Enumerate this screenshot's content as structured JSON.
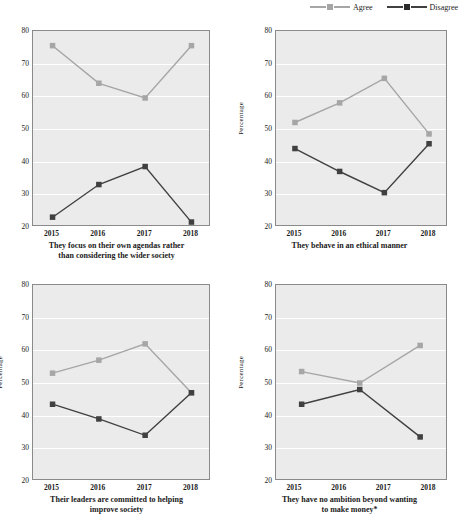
{
  "legend": {
    "items": [
      {
        "label": "Agree",
        "color": "#a6a6a6"
      },
      {
        "label": "Disagree",
        "color": "#404040"
      }
    ]
  },
  "axis": {
    "yticks": [
      20,
      30,
      40,
      50,
      60,
      70,
      80
    ],
    "xticks": [
      "2015",
      "2016",
      "2017",
      "2018"
    ],
    "ylabel": "Percentage"
  },
  "chart_data": [
    {
      "type": "line",
      "title": "They focus on their own agendas rather than considering the wider society",
      "caption_line1": "They focus on their own agendas rather",
      "caption_line2": "than considering the wider society",
      "xlabel": "",
      "ylabel": "",
      "categories": [
        "2015",
        "2016",
        "2017",
        "2018"
      ],
      "ylim": [
        20,
        80
      ],
      "yticks": [
        20,
        30,
        40,
        50,
        60,
        70,
        80
      ],
      "grid": true,
      "legend_position": "top-right",
      "series": [
        {
          "name": "Agree",
          "color": "#a6a6a6",
          "values": [
            75.5,
            64.0,
            59.5,
            75.5
          ]
        },
        {
          "name": "Disagree",
          "color": "#404040",
          "values": [
            23.0,
            33.0,
            38.5,
            21.5
          ]
        }
      ]
    },
    {
      "type": "line",
      "title": "They behave in an ethical manner",
      "caption_line1": "They behave in an ethical manner",
      "caption_line2": "",
      "xlabel": "",
      "ylabel": "Percentage",
      "categories": [
        "2015",
        "2016",
        "2017",
        "2018"
      ],
      "ylim": [
        20,
        80
      ],
      "yticks": [
        20,
        30,
        40,
        50,
        60,
        70,
        80
      ],
      "grid": true,
      "legend_position": "top-right",
      "series": [
        {
          "name": "Agree",
          "color": "#a6a6a6",
          "values": [
            52.0,
            58.0,
            65.5,
            48.5
          ]
        },
        {
          "name": "Disagree",
          "color": "#404040",
          "values": [
            44.0,
            37.0,
            30.5,
            45.5
          ]
        }
      ]
    },
    {
      "type": "line",
      "title": "Their leaders are committed to helping improve society",
      "caption_line1": "Their leaders are committed to helping",
      "caption_line2": "improve society",
      "xlabel": "",
      "ylabel": "Percentage",
      "categories": [
        "2015",
        "2016",
        "2017",
        "2018"
      ],
      "ylim": [
        20,
        80
      ],
      "yticks": [
        20,
        30,
        40,
        50,
        60,
        70,
        80
      ],
      "grid": true,
      "legend_position": "top-right",
      "series": [
        {
          "name": "Agree",
          "color": "#a6a6a6",
          "values": [
            53.0,
            57.0,
            62.0,
            47.0
          ]
        },
        {
          "name": "Disagree",
          "color": "#404040",
          "values": [
            43.5,
            39.0,
            34.0,
            47.0
          ]
        }
      ]
    },
    {
      "type": "line",
      "title": "They have no ambition beyond wanting to make money*",
      "caption_line1": "They have no ambition beyond wanting",
      "caption_line2": "to make money*",
      "xlabel": "",
      "ylabel": "Percentage",
      "categories": [
        "2015",
        "2016",
        "2017",
        "2018"
      ],
      "ylim": [
        20,
        80
      ],
      "yticks": [
        20,
        30,
        40,
        50,
        60,
        70,
        80
      ],
      "grid": true,
      "legend_position": "top-right",
      "note": "only three data points plotted, positioned between year ticks",
      "series": [
        {
          "name": "Agree",
          "color": "#a6a6a6",
          "x": [
            2015.15,
            2016.45,
            2017.8
          ],
          "values": [
            53.5,
            50.0,
            61.5
          ]
        },
        {
          "name": "Disagree",
          "color": "#404040",
          "x": [
            2015.15,
            2016.45,
            2017.8
          ],
          "values": [
            43.5,
            48.0,
            33.5
          ]
        }
      ]
    }
  ]
}
